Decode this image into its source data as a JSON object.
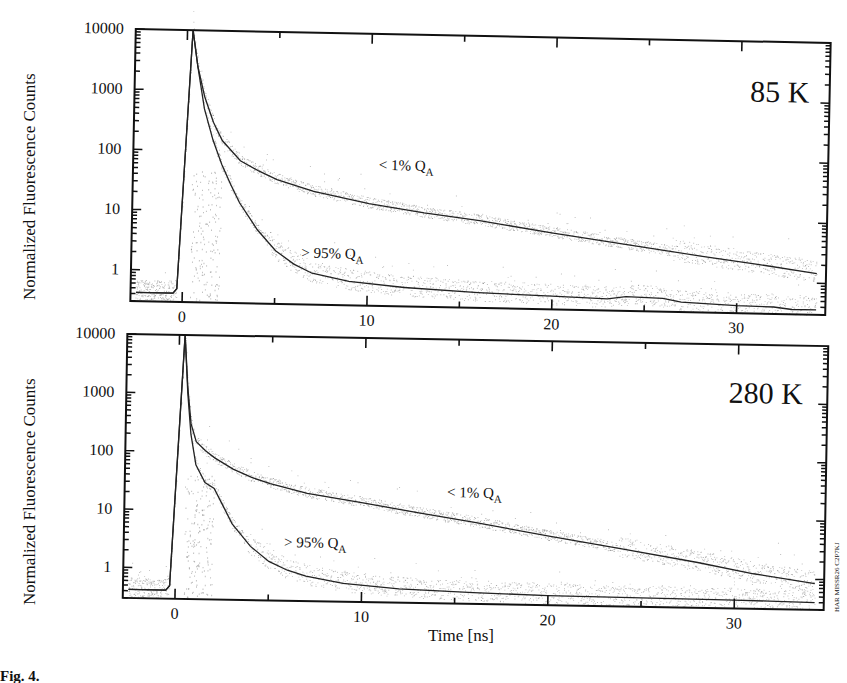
{
  "figure": {
    "ylabel": "Normalized Fluorescence Counts",
    "xlabel": "Time [ns]",
    "watermark": "HAR MISSR26 C2P7KJ",
    "caption_fragment": "Fig. 4."
  },
  "chart_data": [
    {
      "type": "line",
      "title": "85 K",
      "xlabel": "Time [ns]",
      "ylabel": "Normalized Fluorescence Counts",
      "yscale": "log",
      "xlim": [
        -2.8,
        34.8
      ],
      "ylim": [
        0.3,
        10000
      ],
      "xticks": [
        0,
        10,
        20,
        30
      ],
      "yticks": [
        1,
        10,
        100,
        1000,
        10000
      ],
      "ytick_labels": [
        "1",
        "10",
        "100",
        "1000",
        "10000"
      ],
      "annotations": [
        {
          "text": "85 K",
          "x": 30.5,
          "y": 1000
        },
        {
          "text": "< 1% Q",
          "sub": "A",
          "x": 10.5,
          "y": 55
        },
        {
          "text": "> 95% Q",
          "sub": "A",
          "x": 6.4,
          "y": 1.8
        }
      ],
      "series": [
        {
          "name": "< 1% QA",
          "x": [
            -2.5,
            -0.5,
            -0.3,
            0.3,
            0.6,
            1,
            1.5,
            2,
            3,
            4,
            5,
            7,
            10,
            13,
            16,
            20,
            24,
            28,
            31,
            34.3
          ],
          "y": [
            0.42,
            0.42,
            0.5,
            10000,
            2500,
            800,
            300,
            150,
            70,
            48,
            35,
            23,
            15,
            11,
            8.5,
            5.6,
            3.8,
            2.6,
            2.0,
            1.45
          ]
        },
        {
          "name": "> 95% QA",
          "x": [
            -2.5,
            -0.5,
            -0.3,
            0.3,
            0.6,
            1,
            1.5,
            2,
            2.5,
            3,
            4,
            5,
            6,
            7,
            9,
            12,
            16,
            20,
            23,
            24,
            26,
            27,
            30,
            32,
            33,
            34.3
          ],
          "y": [
            0.42,
            0.42,
            0.5,
            10000,
            2500,
            500,
            150,
            60,
            28,
            14,
            5,
            2.3,
            1.4,
            1.0,
            0.75,
            0.62,
            0.54,
            0.5,
            0.47,
            0.52,
            0.5,
            0.44,
            0.4,
            0.39,
            0.36,
            0.36
          ]
        }
      ]
    },
    {
      "type": "line",
      "title": "280 K",
      "xlabel": "Time [ns]",
      "ylabel": "Normalized Fluorescence Counts",
      "yscale": "log",
      "xlim": [
        -2.8,
        34.8
      ],
      "ylim": [
        0.3,
        10000
      ],
      "xticks": [
        0,
        10,
        20,
        30
      ],
      "yticks": [
        1,
        10,
        100,
        1000,
        10000
      ],
      "ytick_labels": [
        "1",
        "10",
        "100",
        "1000",
        "10000"
      ],
      "annotations": [
        {
          "text": "280 K",
          "x": 29.5,
          "y": 1000
        },
        {
          "text": "< 1% Q",
          "sub": "A",
          "x": 14.5,
          "y": 20
        },
        {
          "text": "> 95% Q",
          "sub": "A",
          "x": 5.8,
          "y": 2.5
        }
      ],
      "series": [
        {
          "name": "< 1% QA",
          "x": [
            -2.5,
            -0.5,
            -0.3,
            0.3,
            0.5,
            0.7,
            1,
            1.5,
            2,
            3,
            4,
            5,
            7,
            10,
            13,
            16,
            20,
            24,
            28,
            31,
            34.3
          ],
          "y": [
            0.42,
            0.42,
            0.5,
            10000,
            1200,
            300,
            150,
            105,
            80,
            52,
            38,
            30,
            21,
            15,
            10.5,
            7.5,
            4.6,
            2.9,
            1.8,
            1.2,
            0.85
          ]
        },
        {
          "name": "> 95% QA",
          "x": [
            -2.5,
            -0.5,
            -0.3,
            0.3,
            0.5,
            0.7,
            1,
            1.5,
            2,
            2.5,
            3,
            4,
            5,
            6,
            7,
            9,
            12,
            16,
            20,
            25,
            30,
            34.3
          ],
          "y": [
            0.42,
            0.42,
            0.5,
            10000,
            1000,
            200,
            60,
            30,
            24,
            12,
            6,
            2.5,
            1.4,
            1.0,
            0.8,
            0.62,
            0.52,
            0.47,
            0.44,
            0.43,
            0.42,
            0.4
          ]
        }
      ]
    }
  ]
}
